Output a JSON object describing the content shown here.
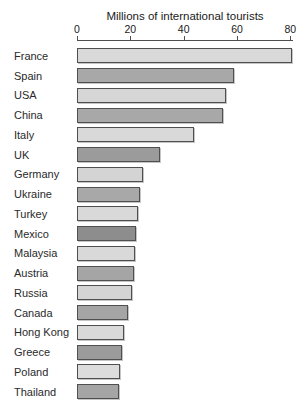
{
  "chart_data": {
    "type": "bar",
    "orientation": "horizontal",
    "title": "Millions of international tourists",
    "axis_position": "top",
    "xlabel": "",
    "ylabel": "",
    "xlim": [
      0,
      81
    ],
    "ticks": [
      0,
      20,
      40,
      60,
      80
    ],
    "grid": false,
    "categories": [
      "France",
      "Spain",
      "USA",
      "China",
      "Italy",
      "UK",
      "Germany",
      "Ukraine",
      "Turkey",
      "Mexico",
      "Malaysia",
      "Austria",
      "Russia",
      "Canada",
      "Hong Kong",
      "Greece",
      "Poland",
      "Thailand"
    ],
    "values": [
      80,
      58,
      55,
      54,
      43,
      30.5,
      24,
      23,
      22,
      21.5,
      21,
      20.5,
      20,
      18.5,
      17,
      16,
      15.5,
      15
    ],
    "bar_colors": [
      "#d9d9d9",
      "#a8a8a8",
      "#d6d6d6",
      "#a8a8a8",
      "#d9d9d9",
      "#9b9b9b",
      "#d4d4d4",
      "#a8a8a8",
      "#d9d9d9",
      "#8d8d8d",
      "#d9d9d9",
      "#a5a5a5",
      "#d4d4d4",
      "#a5a5a5",
      "#d9d9d9",
      "#9b9b9b",
      "#dcdcdc",
      "#a5a5a5"
    ],
    "bar_border_color": "#4f4f4f",
    "axis_color": "#4f4f4f"
  }
}
